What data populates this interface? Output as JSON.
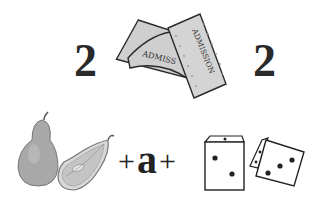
{
  "puzzle": {
    "type": "rebus",
    "top_row": {
      "left_number": "2",
      "image": "admission-tickets",
      "ticket_text_1": "ADMISS",
      "ticket_text_2": "ADMISSION",
      "right_number": "2"
    },
    "bottom_row": {
      "image_left": "pears",
      "plus_1": "+",
      "letter": "a",
      "plus_2": "+",
      "image_right": "dice"
    }
  },
  "colors": {
    "ink": "#2a2a2a",
    "ticket_fill": "#cfcfcf",
    "pear_fill": "#a8a8a8",
    "background": "#ffffff"
  }
}
